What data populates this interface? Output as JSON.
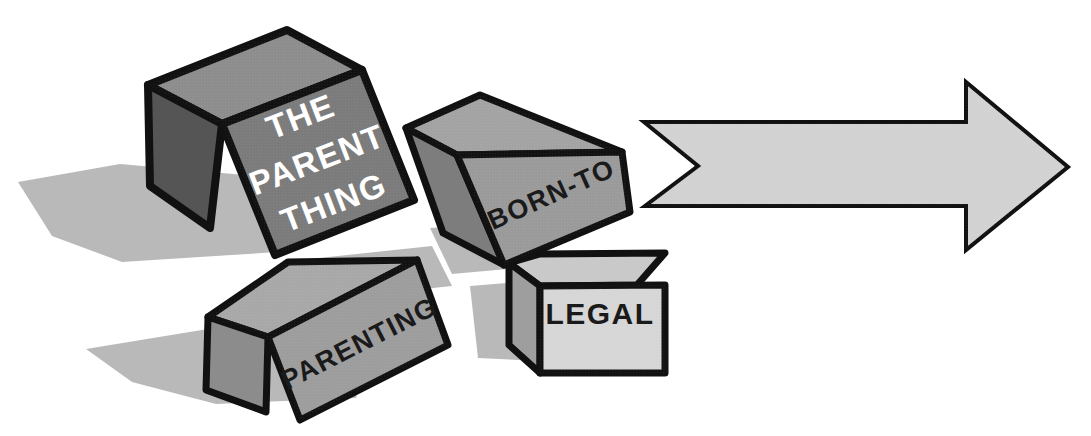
{
  "illustration": {
    "title": "Stacked labeled boxes with a large right-pointing arrow",
    "background_color": "#ffffff",
    "outline_color": "#111111",
    "shadow_color": "#b9b9b9",
    "canvas": {
      "width": 1091,
      "height": 436
    }
  },
  "boxes": [
    {
      "id": "the-parent-thing",
      "label": "THE PARENT THING",
      "label_lines": [
        "THE",
        "PARENT",
        "THING"
      ],
      "text_color": "#ffffff",
      "face_colors": {
        "top": "#8d8d8d",
        "left": "#555555",
        "front": "#7b7b7b"
      },
      "rotation_deg": -21,
      "size": "large"
    },
    {
      "id": "born-to",
      "label": "BORN-TO",
      "label_lines": [
        "BORN-TO"
      ],
      "text_color": "#1a1a1a",
      "face_colors": {
        "top": "#a3a3a3",
        "left": "#7d7d7d",
        "front": "#9a9a9a"
      },
      "rotation_deg": -22,
      "size": "medium"
    },
    {
      "id": "parenting",
      "label": "PARENTING",
      "label_lines": [
        "PARENTING"
      ],
      "text_color": "#1a1a1a",
      "face_colors": {
        "top": "#a8a8a8",
        "left": "#8c8c8c",
        "front": "#9d9d9d"
      },
      "rotation_deg": -24,
      "size": "long"
    },
    {
      "id": "legal",
      "label": "LEGAL",
      "label_lines": [
        "LEGAL"
      ],
      "text_color": "#1a1a1a",
      "face_colors": {
        "top": "#c9c9c9",
        "left": "#9e9e9e",
        "front": "#d6d6d6"
      },
      "rotation_deg": 0,
      "size": "small"
    }
  ],
  "arrow": {
    "id": "right-arrow",
    "direction": "right",
    "fill_color": "#d2d2d2",
    "outline_color": "#111111",
    "label": ""
  },
  "shadows": [
    {
      "id": "shadow-upper",
      "color": "#b9b9b9"
    },
    {
      "id": "shadow-lower",
      "color": "#b9b9b9"
    }
  ]
}
